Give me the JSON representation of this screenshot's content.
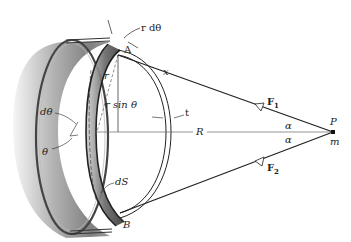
{
  "figure": {
    "colors": {
      "ink": "#222222",
      "shell_dark": "#555555",
      "shell_mid": "#9a9a9a",
      "shell_light": "#d8d8d8",
      "background": "#ffffff"
    },
    "labels": {
      "r_dtheta": "r dθ",
      "A": "A",
      "x": "x",
      "r": "r",
      "r_sin_theta": "r sin θ",
      "t": "t",
      "d_theta": "dθ",
      "theta": "θ",
      "R": "R",
      "F1": "F",
      "F1_sub": "1",
      "F2": "F",
      "F2_sub": "2",
      "alpha_top": "α",
      "alpha_bottom": "α",
      "P": "P",
      "m": "m",
      "dS": "dS",
      "B": "B"
    }
  }
}
